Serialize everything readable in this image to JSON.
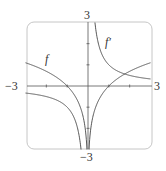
{
  "chart_data": {
    "type": "line",
    "title": "",
    "xlabel": "",
    "ylabel": "",
    "xlim": [
      -3,
      3
    ],
    "ylim": [
      -3,
      3
    ],
    "grid": false,
    "tick_labels": {
      "x_left": "−3",
      "x_right": "3",
      "y_top": "3",
      "y_bottom": "−3"
    },
    "series": [
      {
        "name": "f",
        "label": "f",
        "expression": "ln|x|",
        "x": [
          -3,
          -2.5,
          -2,
          -1.5,
          -1,
          -0.7,
          -0.5,
          -0.3,
          -0.2,
          -0.1,
          -0.05,
          0.05,
          0.1,
          0.2,
          0.3,
          0.5,
          0.7,
          1,
          1.5,
          2,
          2.5,
          3
        ],
        "values": [
          1.1,
          0.92,
          0.69,
          0.41,
          0,
          -0.36,
          -0.69,
          -1.2,
          -1.61,
          -2.3,
          -3.0,
          -3.0,
          -2.3,
          -1.61,
          -1.2,
          -0.69,
          -0.36,
          0,
          0.41,
          0.69,
          0.92,
          1.1
        ]
      },
      {
        "name": "f'",
        "label": "f′",
        "expression": "1/x",
        "x": [
          -3,
          -2.5,
          -2,
          -1.5,
          -1,
          -0.7,
          -0.5,
          -0.4,
          -0.34,
          0.34,
          0.4,
          0.5,
          0.7,
          1,
          1.5,
          2,
          2.5,
          3
        ],
        "values": [
          -0.33,
          -0.4,
          -0.5,
          -0.67,
          -1,
          -1.43,
          -2,
          -2.5,
          -3.0,
          3.0,
          2.5,
          2,
          1.43,
          1,
          0.67,
          0.5,
          0.4,
          0.33
        ]
      }
    ],
    "annotations": [
      {
        "text": "f",
        "x": -2.0,
        "y": 1.2
      },
      {
        "text": "f′",
        "x": 0.9,
        "y": 2.0
      }
    ]
  },
  "labels": {
    "f": "f",
    "fprime": "f′",
    "x_left": "−3",
    "x_right": "3",
    "y_top": "3",
    "y_bottom": "−3"
  }
}
